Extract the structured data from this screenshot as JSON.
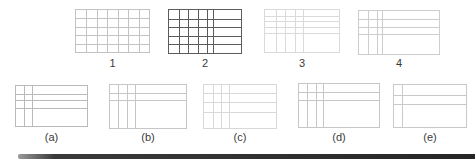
{
  "figure": {
    "background": "#ffffff",
    "rows": [
      {
        "name": "top-row",
        "label_y": 56,
        "grids": [
          {
            "id": "grid-1",
            "label": "1",
            "x": 75,
            "y": 9,
            "w": 75,
            "h": 44,
            "color": "#c3c3c3",
            "vlines": [
              0.143,
              0.286,
              0.429,
              0.571,
              0.714,
              0.857
            ],
            "hlines": [
              0.2,
              0.4,
              0.6,
              0.8
            ]
          },
          {
            "id": "grid-2",
            "label": "2",
            "x": 168,
            "y": 9,
            "w": 74,
            "h": 45,
            "color": "#5c5c5c",
            "vlines": [
              0.135,
              0.27,
              0.405,
              0.525,
              0.615
            ],
            "hlines": [
              0.2,
              0.4,
              0.6,
              0.8
            ]
          },
          {
            "id": "grid-3",
            "label": "3",
            "x": 264,
            "y": 9,
            "w": 76,
            "h": 44,
            "color": "#dadada",
            "vlines": [
              0.145,
              0.27,
              0.4,
              0.51
            ],
            "hlines": [
              0.135,
              0.27,
              0.41,
              0.545
            ]
          },
          {
            "id": "grid-4",
            "label": "4",
            "x": 358,
            "y": 10,
            "w": 82,
            "h": 45,
            "color": "#cdcdcd",
            "vlines": [
              0.118,
              0.22,
              0.29
            ],
            "hlines": [
              0.19,
              0.38,
              0.53
            ]
          }
        ]
      },
      {
        "name": "bottom-row",
        "label_y": 130,
        "grids": [
          {
            "id": "grid-a",
            "label": "(a)",
            "x": 15,
            "y": 85,
            "w": 73,
            "h": 42,
            "color": "#bababa",
            "vlines": [
              0.114,
              0.229
            ],
            "hlines": [
              0.198,
              0.357,
              0.555
            ]
          },
          {
            "id": "grid-b",
            "label": "(b)",
            "x": 109,
            "y": 84,
            "w": 78,
            "h": 45,
            "color": "#c6c6c6",
            "vlines": [
              0.111,
              0.218,
              0.324
            ],
            "hlines": [
              0.19,
              0.345
            ]
          },
          {
            "id": "grid-c",
            "label": "(c)",
            "x": 203,
            "y": 84,
            "w": 74,
            "h": 45,
            "color": "#d8d8d8",
            "vlines": [
              0.13,
              0.24,
              0.35
            ],
            "hlines": [
              0.18,
              0.4,
              0.63
            ]
          },
          {
            "id": "grid-d",
            "label": "(d)",
            "x": 298,
            "y": 83,
            "w": 82,
            "h": 45,
            "color": "#c6c6c6",
            "vlines": [
              0.106,
              0.207,
              0.3
            ],
            "hlines": [
              0.185,
              0.37
            ]
          },
          {
            "id": "grid-e",
            "label": "(e)",
            "x": 393,
            "y": 84,
            "w": 74,
            "h": 44,
            "color": "#c9c9c9",
            "vlines": [
              0.108
            ],
            "hlines": [
              0.227,
              0.455
            ]
          }
        ]
      }
    ],
    "bottom_bar": {
      "x": 18,
      "y": 154,
      "w": 457,
      "h": 5,
      "color_left": "#9a9a9a",
      "color_mid": "#3a3a3a",
      "color_right": "#262626"
    }
  }
}
